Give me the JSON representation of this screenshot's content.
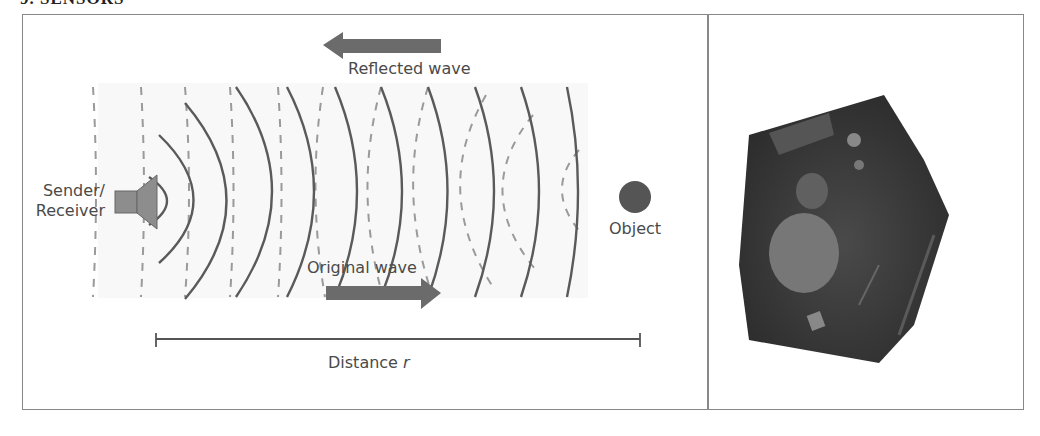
{
  "header": {
    "title": "9. SENSORS"
  },
  "diagram": {
    "reflected_label": "Reflected wave",
    "original_label": "Original wave",
    "sender_label_line1": "Sender/",
    "sender_label_line2": "Receiver",
    "object_label": "Object",
    "distance_label": "Distance",
    "distance_var": "r",
    "colors": {
      "arrow": "#6b6b6b",
      "wave_solid": "#5a5a5a",
      "wave_dashed": "#9a9a9a",
      "object": "#555555",
      "speaker": "#8d8d8d"
    }
  },
  "photo": {
    "description": "ultrasonic sensor module photo"
  }
}
